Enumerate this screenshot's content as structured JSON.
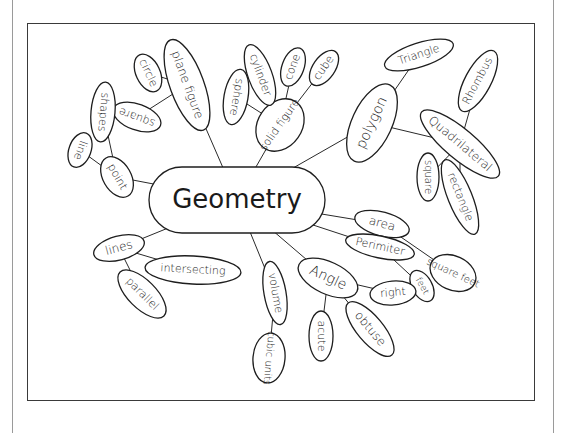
{
  "diagram": {
    "type": "mind-map",
    "title": "Geometry",
    "colors": {
      "ink": "#1e1e1e",
      "paper": "#ffffff",
      "frame": "#3a3a3a",
      "page_rule": "#9a9a9a"
    },
    "center": {
      "id": "geometry",
      "label": "Geometry",
      "cx": 237,
      "cy": 200,
      "rx": 88,
      "ry": 33,
      "font": 26
    },
    "nodes": [
      {
        "id": "plane-figure",
        "label": "plane figure",
        "parent": "geometry",
        "cx": 187,
        "cy": 85,
        "rx": 48,
        "ry": 17,
        "rot": 70,
        "font": 12
      },
      {
        "id": "circle",
        "label": "circle",
        "parent": "plane-figure",
        "cx": 148,
        "cy": 73,
        "rx": 20,
        "ry": 12,
        "rot": 65,
        "font": 11
      },
      {
        "id": "square-1",
        "label": "square",
        "parent": "plane-figure",
        "cx": 137,
        "cy": 117,
        "rx": 25,
        "ry": 13,
        "rot": 200,
        "font": 11
      },
      {
        "id": "shapes",
        "label": "shapes",
        "parent": "point",
        "cx": 103,
        "cy": 112,
        "rx": 30,
        "ry": 12,
        "rot": 95,
        "font": 11
      },
      {
        "id": "point",
        "label": "point",
        "parent": "geometry",
        "cx": 117,
        "cy": 177,
        "rx": 22,
        "ry": 14,
        "rot": 60,
        "font": 11
      },
      {
        "id": "line",
        "label": "line",
        "parent": "point",
        "cx": 80,
        "cy": 150,
        "rx": 18,
        "ry": 11,
        "rot": 110,
        "font": 11
      },
      {
        "id": "solid-figure",
        "label": "solid figure",
        "parent": "geometry",
        "cx": 280,
        "cy": 125,
        "rx": 28,
        "ry": 22,
        "rot": -55,
        "font": 11
      },
      {
        "id": "sphere",
        "label": "sphere",
        "parent": "solid-figure",
        "cx": 236,
        "cy": 97,
        "rx": 28,
        "ry": 12,
        "rot": 100,
        "font": 11
      },
      {
        "id": "cylinder",
        "label": "cylinder",
        "parent": "solid-figure",
        "cx": 260,
        "cy": 75,
        "rx": 32,
        "ry": 12,
        "rot": 70,
        "font": 11
      },
      {
        "id": "cone",
        "label": "cone",
        "parent": "solid-figure",
        "cx": 293,
        "cy": 67,
        "rx": 20,
        "ry": 11,
        "rot": -70,
        "font": 11
      },
      {
        "id": "cube",
        "label": "cube",
        "parent": "solid-figure",
        "cx": 324,
        "cy": 68,
        "rx": 20,
        "ry": 11,
        "rot": -55,
        "font": 11
      },
      {
        "id": "polygon",
        "label": "polygon",
        "parent": "geometry",
        "cx": 372,
        "cy": 123,
        "rx": 42,
        "ry": 20,
        "rot": -65,
        "font": 14
      },
      {
        "id": "triangle",
        "label": "Triangle",
        "parent": "polygon",
        "cx": 419,
        "cy": 55,
        "rx": 36,
        "ry": 12,
        "rot": -18,
        "font": 11
      },
      {
        "id": "quadrilateral",
        "label": "Quadrilateral",
        "parent": "polygon",
        "cx": 460,
        "cy": 144,
        "rx": 50,
        "ry": 15,
        "rot": 40,
        "font": 12
      },
      {
        "id": "rhombus",
        "label": "Rhombus",
        "parent": "quadrilateral",
        "cx": 478,
        "cy": 81,
        "rx": 34,
        "ry": 13,
        "rot": -62,
        "font": 11
      },
      {
        "id": "square-2",
        "label": "square",
        "parent": "quadrilateral",
        "cx": 428,
        "cy": 177,
        "rx": 24,
        "ry": 11,
        "rot": 90,
        "font": 10
      },
      {
        "id": "rectangle",
        "label": "rectangle",
        "parent": "quadrilateral",
        "cx": 460,
        "cy": 197,
        "rx": 40,
        "ry": 12,
        "rot": 68,
        "font": 11
      },
      {
        "id": "area",
        "label": "area",
        "parent": "geometry",
        "cx": 382,
        "cy": 224,
        "rx": 28,
        "ry": 12,
        "rot": 15,
        "font": 12
      },
      {
        "id": "perimiter",
        "label": "Perimiter",
        "parent": "geometry",
        "cx": 380,
        "cy": 247,
        "rx": 35,
        "ry": 11,
        "rot": 12,
        "font": 11
      },
      {
        "id": "square-feet",
        "label": "square feet",
        "parent": "area",
        "cx": 453,
        "cy": 273,
        "rx": 24,
        "ry": 17,
        "rot": 25,
        "font": 10
      },
      {
        "id": "feet",
        "label": "feet",
        "parent": "perimiter",
        "cx": 422,
        "cy": 286,
        "rx": 17,
        "ry": 10,
        "rot": 60,
        "font": 9,
        "bold": true
      },
      {
        "id": "angle",
        "label": "Angle",
        "parent": "geometry",
        "cx": 328,
        "cy": 278,
        "rx": 32,
        "ry": 16,
        "rot": 25,
        "font": 14
      },
      {
        "id": "right",
        "label": "right",
        "parent": "angle",
        "cx": 393,
        "cy": 293,
        "rx": 23,
        "ry": 12,
        "rot": -5,
        "font": 11
      },
      {
        "id": "acute",
        "label": "acute",
        "parent": "angle",
        "cx": 321,
        "cy": 336,
        "rx": 25,
        "ry": 12,
        "rot": 90,
        "font": 11
      },
      {
        "id": "obtuse",
        "label": "obtuse",
        "parent": "angle",
        "cx": 370,
        "cy": 329,
        "rx": 34,
        "ry": 13,
        "rot": 50,
        "font": 12
      },
      {
        "id": "volume",
        "label": "volume",
        "parent": "geometry",
        "cx": 275,
        "cy": 293,
        "rx": 32,
        "ry": 11,
        "rot": 80,
        "font": 11
      },
      {
        "id": "cubic-units",
        "label": "cubic units",
        "parent": "volume",
        "cx": 269,
        "cy": 358,
        "rx": 25,
        "ry": 16,
        "rot": 95,
        "font": 10
      },
      {
        "id": "lines",
        "label": "lines",
        "parent": "geometry",
        "cx": 119,
        "cy": 248,
        "rx": 26,
        "ry": 12,
        "rot": -15,
        "font": 12
      },
      {
        "id": "intersecting",
        "label": "intersecting",
        "parent": "lines",
        "cx": 193,
        "cy": 270,
        "rx": 48,
        "ry": 14,
        "rot": 3,
        "font": 11
      },
      {
        "id": "parallel",
        "label": "parallel",
        "parent": "lines",
        "cx": 142,
        "cy": 294,
        "rx": 31,
        "ry": 14,
        "rot": 45,
        "font": 11
      }
    ]
  }
}
